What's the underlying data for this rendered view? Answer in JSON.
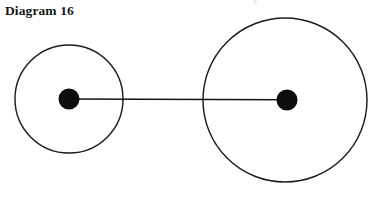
{
  "page": {
    "width": 386,
    "height": 197,
    "background_color": "#ffffff"
  },
  "title": {
    "text": "Diagram 16"
  },
  "figure": {
    "label": "two-circles-connected-by-line",
    "stroke_color": "#1d1d1d",
    "dot_color": "#0d0d0d",
    "line_color": "#141414",
    "fill_color": "none",
    "small_circle": {
      "name": "small circle",
      "center_x": 69,
      "center_y": 99,
      "radius": 54,
      "stroke_width": 1.45
    },
    "large_circle": {
      "name": "large circle",
      "center_x": 285,
      "center_y": 100,
      "radius": 82,
      "stroke_width": 1.45
    },
    "small_circle_center_dot": {
      "name": "small circle center point",
      "center_x": 69,
      "center_y": 99,
      "radius": 10.5
    },
    "large_circle_center_dot": {
      "name": "large circle center point",
      "center_x": 287,
      "center_y": 100,
      "radius": 10.5
    },
    "connector": {
      "name": "center-to-center line",
      "x1": 69,
      "y1": 99,
      "x2": 287,
      "y2": 99.8,
      "stroke_width": 1.6
    },
    "speck": {
      "center_x": 255,
      "center_y": 2,
      "radius": 2.2,
      "color": "#f0f0f0"
    }
  }
}
